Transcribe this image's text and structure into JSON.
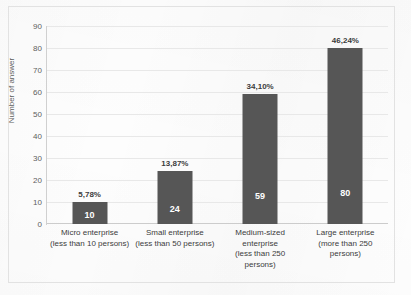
{
  "chart_data": {
    "type": "bar",
    "title": "",
    "xlabel": "",
    "ylabel": "Number of answer",
    "ylim": [
      0,
      90
    ],
    "ytick_step": 10,
    "yticks": [
      90,
      80,
      70,
      60,
      50,
      40,
      30,
      20,
      10,
      0
    ],
    "grid": true,
    "legend": "none",
    "bar_color": "#565656",
    "categories": [
      "Micro enterprise (less than 10 persons)",
      "Small enterprise (less than 50 persons)",
      "Medium-sized enterprise (less than 250 persons)",
      "Large enterprise (more than 250 persons)"
    ],
    "category_lines": [
      [
        "Micro enterprise",
        "(less than 10 persons)"
      ],
      [
        "Small enterprise",
        "(less than 50 persons)"
      ],
      [
        "Medium-sized",
        "enterprise",
        "(less than 250",
        "persons)"
      ],
      [
        "Large enterprise",
        "(more than 250",
        "persons)"
      ]
    ],
    "values": [
      10,
      24,
      59,
      80
    ],
    "value_labels": [
      "10",
      "24",
      "59",
      "80"
    ],
    "percent_labels": [
      "5,78%",
      "13,87%",
      "34,10%",
      "46,24%"
    ]
  }
}
